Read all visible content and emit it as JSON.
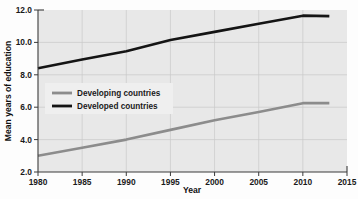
{
  "chart_data": {
    "type": "line",
    "title": "",
    "xlabel": "Year",
    "ylabel": "Mean years of education",
    "xlim": [
      1980,
      2015
    ],
    "ylim": [
      2.0,
      12.0
    ],
    "xticks": [
      1980,
      1985,
      1990,
      1995,
      2000,
      2005,
      2010,
      2015
    ],
    "xtick_labels": [
      "1980",
      "1985",
      "1990",
      "1995",
      "2000",
      "2005",
      "2010",
      "2015"
    ],
    "yticks": [
      2.0,
      4.0,
      6.0,
      8.0,
      10.0,
      12.0
    ],
    "ytick_labels": [
      "2.0",
      "4.0",
      "6.0",
      "8.0",
      "10.0",
      "12.0"
    ],
    "grid": true,
    "legend_position": "center-left",
    "x": [
      1980,
      1985,
      1990,
      1995,
      2000,
      2005,
      2010,
      2013
    ],
    "series": [
      {
        "name": "Developing countries",
        "color": "#8c8c8c",
        "values": [
          3.0,
          3.5,
          4.0,
          4.6,
          5.2,
          5.7,
          6.25,
          6.25
        ]
      },
      {
        "name": "Developed countries",
        "color": "#141414",
        "values": [
          8.4,
          8.95,
          9.45,
          10.15,
          10.65,
          11.15,
          11.65,
          11.62
        ]
      }
    ]
  },
  "legend": {
    "entries": [
      {
        "label": "Developing countries",
        "color": "#8c8c8c"
      },
      {
        "label": "Developed countries",
        "color": "#141414"
      }
    ]
  },
  "axes": {
    "x_title": "Year",
    "y_title": "Mean years of education"
  }
}
